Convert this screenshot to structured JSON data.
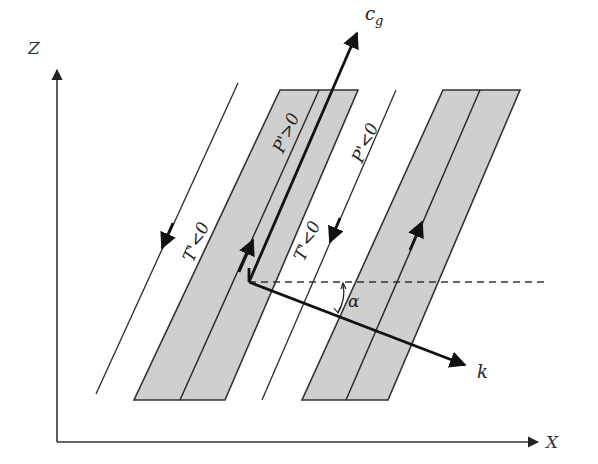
{
  "figure": {
    "width": 598,
    "height": 464,
    "background": "#ffffff",
    "band_fill": "#cfcfcf",
    "line_color": "#2b2b2b"
  },
  "axes": {
    "z_label": "Z",
    "x_label": "X",
    "origin": [
      57,
      442
    ],
    "z_tip": [
      57,
      68
    ],
    "x_tip": [
      540,
      442
    ]
  },
  "bands": [
    {
      "name": "band-1",
      "polygon": [
        [
          134,
          400
        ],
        [
          225,
          400
        ],
        [
          358,
          90
        ],
        [
          280,
          90
        ]
      ],
      "center_line": [
        [
          180,
          400
        ],
        [
          319,
          90
        ]
      ],
      "label": "P'>0",
      "flow_arrow_direction": "up"
    },
    {
      "name": "band-2",
      "polygon": [
        [
          302,
          400
        ],
        [
          388,
          400
        ],
        [
          520,
          90
        ],
        [
          443,
          90
        ]
      ],
      "center_line": [
        [
          346,
          400
        ],
        [
          480,
          90
        ]
      ],
      "flow_arrow_direction": "up"
    }
  ],
  "thin_lines": [
    {
      "name": "line-left",
      "from": [
        96,
        394
      ],
      "to": [
        238,
        83
      ],
      "label": "T'<0",
      "flow_arrow_direction": "down"
    },
    {
      "name": "line-middle",
      "from": [
        262,
        400
      ],
      "to": [
        396,
        90
      ],
      "label": "T'<0",
      "label2": "P'<0",
      "flow_arrow_direction": "down"
    }
  ],
  "vectors": {
    "group_velocity": {
      "label": "c",
      "subscript": "g",
      "from": [
        249,
        282
      ],
      "to": [
        358,
        30
      ]
    },
    "wavenumber": {
      "label": "k",
      "from": [
        249,
        282
      ],
      "to": [
        468,
        366
      ]
    }
  },
  "reference_line": {
    "style": "dashed",
    "from": [
      249,
      282
    ],
    "to": [
      545,
      282
    ]
  },
  "angle": {
    "label": "α",
    "vertex": [
      249,
      282
    ]
  },
  "labels": {
    "p_pos": "P'>0",
    "p_neg": "P'<0",
    "t_neg_left": "T'<0",
    "t_neg_mid": "T'<0",
    "cg": "c",
    "cg_sub": "g",
    "k": "k",
    "alpha": "α",
    "z": "Z",
    "x": "X"
  }
}
